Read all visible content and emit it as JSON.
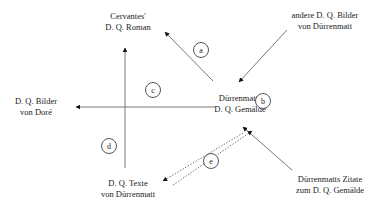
{
  "diagram": {
    "center": [
      "Dürrenmatts",
      "D. Q. Gemälde"
    ],
    "nodes": {
      "cervantes": [
        "Cervantes'",
        "D. Q. Roman"
      ],
      "andere": [
        "andere D. Q. Bilder",
        "von Dürrenmatt"
      ],
      "dore": [
        "D. Q. Bilder",
        "von Doré"
      ],
      "texte": [
        "D. Q. Texte",
        "von Dürrenmatt"
      ],
      "zitate": [
        "Dürrenmatts Zitate",
        "zum D. Q. Gemälde"
      ]
    },
    "labels": {
      "a": "a",
      "b": "b",
      "c": "c",
      "d": "d",
      "e": "e"
    },
    "edges": [
      {
        "from": "center",
        "to": "cervantes",
        "label": "a",
        "style": "solid"
      },
      {
        "from": "andere",
        "to": "center",
        "label": "",
        "style": "solid"
      },
      {
        "from": "zitate",
        "to": "center",
        "label": "b",
        "style": "solid"
      },
      {
        "from": "center",
        "to": "dore",
        "label": "c",
        "style": "solid"
      },
      {
        "from": "texte",
        "to": "cervantes",
        "label": "d",
        "style": "solid"
      },
      {
        "from": "center",
        "to": "texte",
        "label": "e",
        "style": "dotted"
      },
      {
        "from": "texte",
        "to": "center",
        "label": "e",
        "style": "dotted"
      }
    ]
  }
}
